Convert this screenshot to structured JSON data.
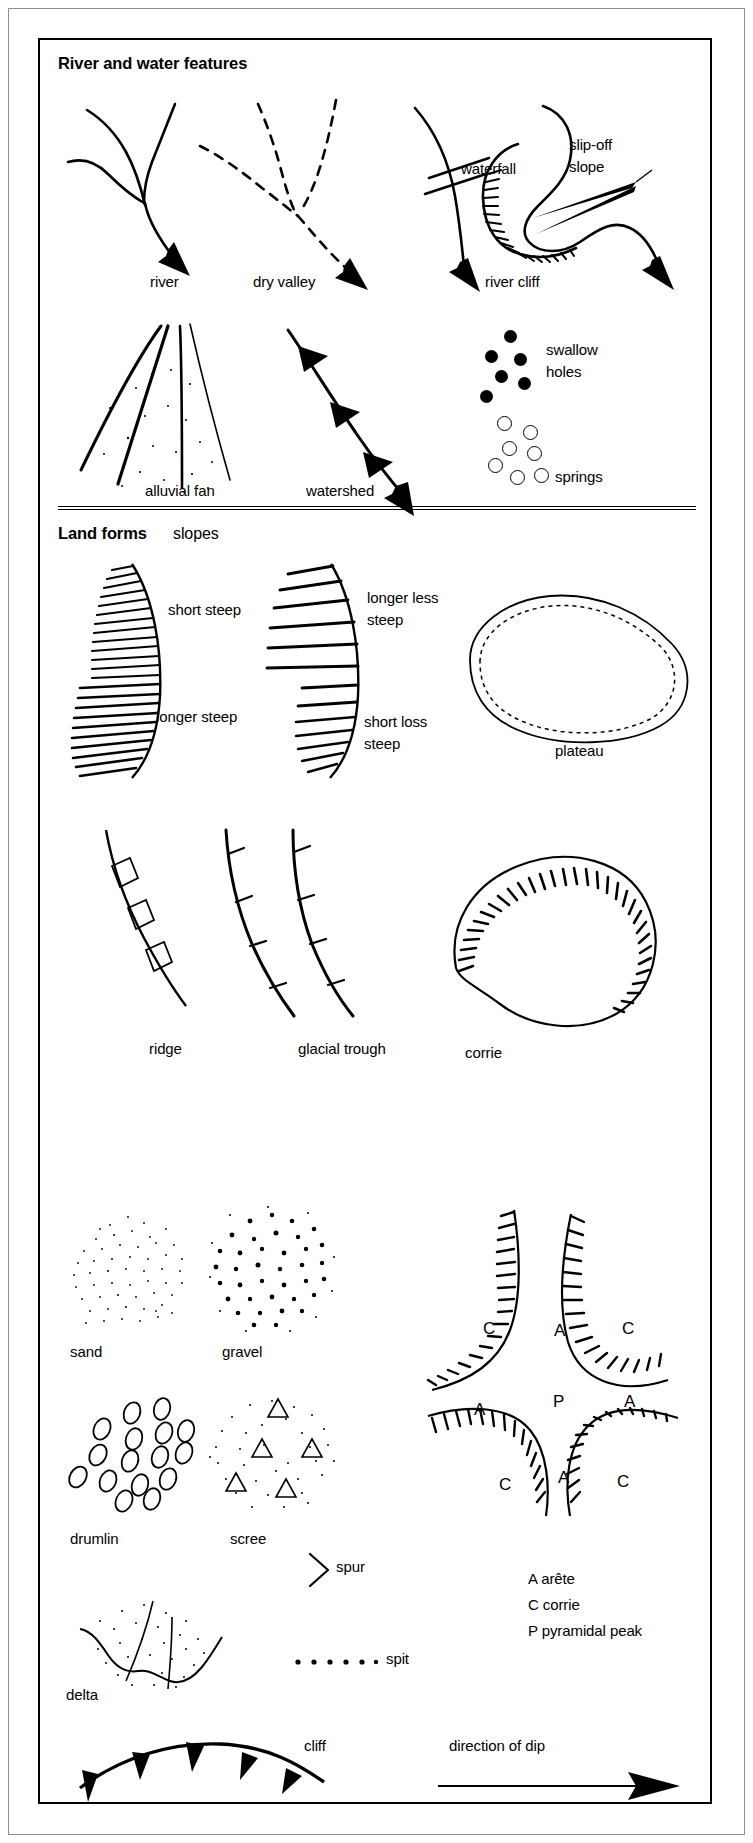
{
  "figure": {
    "background_color": "#ffffff",
    "ink_color": "#000000",
    "page_frame_color": "#8d8d8d"
  },
  "sections": [
    {
      "id": "river-and-water-features",
      "title": "River and water features",
      "subtitle": "",
      "symbols": [
        {
          "key": "river",
          "label": "river"
        },
        {
          "key": "dry-valley",
          "label": "dry valley"
        },
        {
          "key": "waterfall",
          "label": "waterfall"
        },
        {
          "key": "river-cliff",
          "label": "river cliff"
        },
        {
          "key": "slip-off-slope",
          "label": "slip-off"
        },
        {
          "key": "slip-off-slope-2",
          "label": "slope"
        },
        {
          "key": "alluvial-fan",
          "label": "alluvial fan"
        },
        {
          "key": "watershed",
          "label": "watershed"
        },
        {
          "key": "swallow-holes",
          "label": "swallow"
        },
        {
          "key": "swallow-holes-2",
          "label": "holes"
        },
        {
          "key": "springs",
          "label": "springs"
        }
      ]
    },
    {
      "id": "land-forms",
      "title": "Land forms",
      "subtitle": "slopes",
      "symbols": [
        {
          "key": "short-steep",
          "label": "short steep"
        },
        {
          "key": "longer-steep",
          "label": "longer steep"
        },
        {
          "key": "longer-less-steep",
          "label": "longer less"
        },
        {
          "key": "longer-less-steep-2",
          "label": "steep"
        },
        {
          "key": "short-loss-steep",
          "label": "short loss"
        },
        {
          "key": "short-loss-steep-2",
          "label": "steep"
        },
        {
          "key": "plateau",
          "label": "plateau"
        },
        {
          "key": "ridge",
          "label": "ridge"
        },
        {
          "key": "glacial-trough",
          "label": "glacial trough"
        },
        {
          "key": "corrie",
          "label": "corrie"
        },
        {
          "key": "sand",
          "label": "sand"
        },
        {
          "key": "gravel",
          "label": "gravel"
        },
        {
          "key": "drumlin",
          "label": "drumlin"
        },
        {
          "key": "scree",
          "label": "scree"
        },
        {
          "key": "spur",
          "label": "spur"
        },
        {
          "key": "spit",
          "label": "spit"
        },
        {
          "key": "delta",
          "label": "delta"
        },
        {
          "key": "cliff",
          "label": "cliff"
        },
        {
          "key": "direction-of-dip",
          "label": "direction of dip"
        }
      ],
      "legend": [
        {
          "code": "A",
          "term": "arête",
          "text": "A arête"
        },
        {
          "code": "C",
          "term": "corrie",
          "text": "C corrie"
        },
        {
          "code": "P",
          "term": "pyramidal peak",
          "text": "P pyramidal peak"
        }
      ],
      "peak_diagram_letters": [
        {
          "code": "C",
          "position": "upper-left"
        },
        {
          "code": "A",
          "position": "upper-middle"
        },
        {
          "code": "C",
          "position": "upper-right"
        },
        {
          "code": "A",
          "position": "mid-left"
        },
        {
          "code": "P",
          "position": "centre"
        },
        {
          "code": "A",
          "position": "mid-right"
        },
        {
          "code": "C",
          "position": "lower-left"
        },
        {
          "code": "A",
          "position": "lower-middle"
        },
        {
          "code": "C",
          "position": "lower-right"
        }
      ]
    }
  ]
}
